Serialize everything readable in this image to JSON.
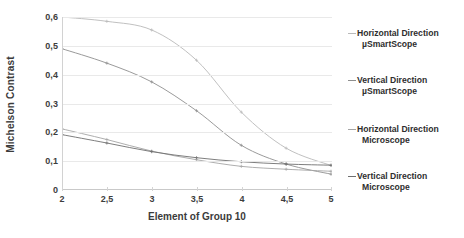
{
  "chart_data": {
    "type": "line",
    "title": "",
    "xlabel": "Element of Group 10",
    "ylabel": "Michelson Contrast",
    "xlim": [
      2,
      5
    ],
    "ylim": [
      0,
      0.6
    ],
    "xticks": [
      "2",
      "2,5",
      "3",
      "3,5",
      "4",
      "4,5",
      "5"
    ],
    "xtick_values": [
      2,
      2.5,
      3,
      3.5,
      4,
      4.5,
      5
    ],
    "yticks": [
      "0",
      "0,1",
      "0,2",
      "0,3",
      "0,4",
      "0,5",
      "0,6"
    ],
    "ytick_values": [
      0,
      0.1,
      0.2,
      0.3,
      0.4,
      0.5,
      0.6
    ],
    "grid": "horizontal",
    "legend_position": "right",
    "x": [
      2,
      2.5,
      3,
      3.5,
      4,
      4.5,
      5
    ],
    "series": [
      {
        "name": "Horizontal Direction µSmartScope",
        "label_line1": "Horizontal Direction",
        "label_line2": "µSmartScope",
        "color": "#b9b9b9",
        "values": [
          0.6,
          0.585,
          0.555,
          0.45,
          0.27,
          0.145,
          0.085
        ]
      },
      {
        "name": "Vertical Direction µSmartScope",
        "label_line1": "Vertical Direction",
        "label_line2": "µSmartScope",
        "color": "#8e8e8e",
        "values": [
          0.49,
          0.44,
          0.375,
          0.275,
          0.155,
          0.09,
          0.055
        ]
      },
      {
        "name": "Horizontal Direction Microscope",
        "label_line1": "Horizontal Direction",
        "label_line2": "Microscope",
        "color": "#a5a5a5",
        "values": [
          0.212,
          0.175,
          0.135,
          0.105,
          0.082,
          0.072,
          0.065
        ]
      },
      {
        "name": "Vertical Direction Microscope",
        "label_line1": "Vertical Direction",
        "label_line2": "Microscope",
        "color": "#6f6f6f",
        "values": [
          0.192,
          0.163,
          0.133,
          0.112,
          0.098,
          0.09,
          0.086
        ]
      }
    ]
  }
}
